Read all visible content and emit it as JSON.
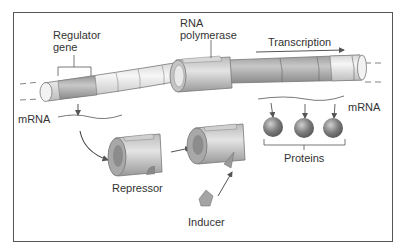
{
  "diagram": {
    "type": "gene regulation (inducible operon)",
    "labels": {
      "regulator_gene_line1": "Regulator",
      "regulator_gene_line2": "gene",
      "rna_polymerase_line1": "RNA",
      "rna_polymerase_line2": "polymerase",
      "transcription": "Transcription",
      "mrna_left": "mRNA",
      "mrna_right": "mRNA",
      "repressor": "Repressor",
      "inducer": "Inducer",
      "proteins": "Proteins"
    },
    "colors": {
      "frame": "#555555",
      "dna_light": "#e8e8e8",
      "dna_dark": "#a9a9a9",
      "protein": "#7a7a7a",
      "arrow": "#555555",
      "text": "#333333"
    },
    "elements": [
      {
        "id": "dna",
        "description": "DNA double helix drawn as a segmented tube"
      },
      {
        "id": "regulator-gene",
        "description": "shaded segment at left end of DNA"
      },
      {
        "id": "rna-polymerase",
        "description": "sleeve bound around DNA"
      },
      {
        "id": "repressor",
        "description": "cylinder-shaped protein"
      },
      {
        "id": "repressor-inducer-complex",
        "description": "repressor with inducer bound"
      },
      {
        "id": "inducer",
        "description": "small wedge molecule"
      },
      {
        "id": "proteins",
        "count": 3,
        "description": "spheres translated from mRNA"
      }
    ]
  }
}
